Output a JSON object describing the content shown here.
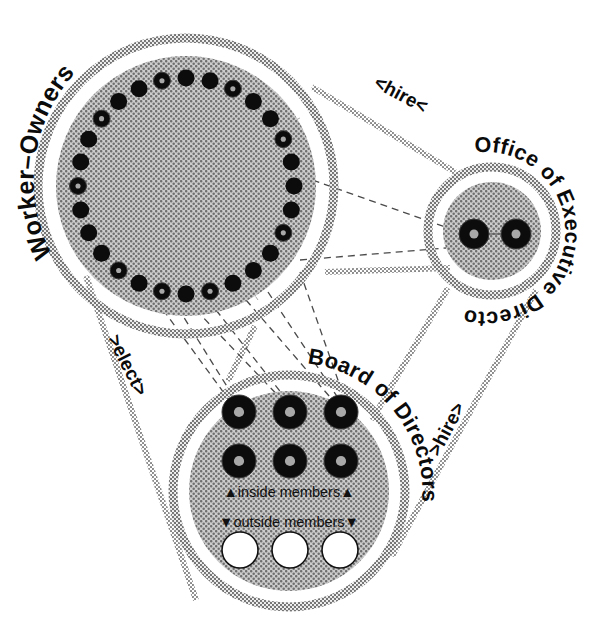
{
  "diagram": {
    "background_color": "#ffffff",
    "ink_color": "#111111",
    "fill_color": "#c8c8c8",
    "ring_color": "#9a9a9a"
  },
  "nodes": [
    {
      "id": "worker-owners",
      "label": "Worker–Owners",
      "cx": 186,
      "cy": 186,
      "outer_r": 148,
      "inner_r": 130,
      "member_ring_r": 108,
      "member_count": 28,
      "member_dot_r": 8.5,
      "members": [
        {
          "index": 0,
          "type": "solid"
        },
        {
          "index": 1,
          "type": "solid"
        },
        {
          "index": 2,
          "type": "ringed"
        },
        {
          "index": 3,
          "type": "solid"
        },
        {
          "index": 4,
          "type": "solid"
        },
        {
          "index": 5,
          "type": "ringed"
        },
        {
          "index": 6,
          "type": "solid"
        },
        {
          "index": 7,
          "type": "solid"
        },
        {
          "index": 8,
          "type": "solid"
        },
        {
          "index": 9,
          "type": "ringed"
        },
        {
          "index": 10,
          "type": "solid"
        },
        {
          "index": 11,
          "type": "solid"
        },
        {
          "index": 12,
          "type": "solid"
        },
        {
          "index": 13,
          "type": "ringed"
        },
        {
          "index": 14,
          "type": "solid"
        },
        {
          "index": 15,
          "type": "ringed"
        },
        {
          "index": 16,
          "type": "solid"
        },
        {
          "index": 17,
          "type": "ringed"
        },
        {
          "index": 18,
          "type": "solid"
        },
        {
          "index": 19,
          "type": "solid"
        },
        {
          "index": 20,
          "type": "solid"
        },
        {
          "index": 21,
          "type": "ringed"
        },
        {
          "index": 22,
          "type": "solid"
        },
        {
          "index": 23,
          "type": "solid"
        },
        {
          "index": 24,
          "type": "ringed"
        },
        {
          "index": 25,
          "type": "solid"
        },
        {
          "index": 26,
          "type": "solid"
        },
        {
          "index": 27,
          "type": "ringed"
        }
      ]
    },
    {
      "id": "office-of-executive-directors",
      "label": "Office of Executive Directors",
      "cx": 492,
      "cy": 231,
      "outer_r": 64,
      "inner_r": 49,
      "members": [
        {
          "id": "exec-1",
          "cx": 474,
          "cy": 234,
          "r": 15,
          "type": "ringed"
        },
        {
          "id": "exec-2",
          "cx": 516,
          "cy": 234,
          "r": 15,
          "type": "ringed"
        }
      ]
    },
    {
      "id": "board-of-directors",
      "label": "Board of Directors",
      "cx": 289,
      "cy": 491,
      "outer_r": 116,
      "inner_r": 100,
      "inside_members_label": "▲inside members▲",
      "outside_members_label": "▼outside members▼",
      "inside_members": [
        {
          "id": "inside-1",
          "cx": 239,
          "cy": 412,
          "r": 17,
          "type": "ringed"
        },
        {
          "id": "inside-2",
          "cx": 290,
          "cy": 412,
          "r": 17,
          "type": "ringed"
        },
        {
          "id": "inside-3",
          "cx": 341,
          "cy": 412,
          "r": 17,
          "type": "ringed"
        },
        {
          "id": "inside-4",
          "cx": 239,
          "cy": 461,
          "r": 17,
          "type": "ringed"
        },
        {
          "id": "inside-5",
          "cx": 290,
          "cy": 461,
          "r": 17,
          "type": "ringed"
        },
        {
          "id": "inside-6",
          "cx": 341,
          "cy": 461,
          "r": 17,
          "type": "ringed"
        }
      ],
      "outside_members": [
        {
          "id": "outside-1",
          "cx": 240,
          "cy": 550,
          "r": 18,
          "type": "hollow"
        },
        {
          "id": "outside-2",
          "cx": 290,
          "cy": 550,
          "r": 18,
          "type": "hollow"
        },
        {
          "id": "outside-3",
          "cx": 340,
          "cy": 550,
          "r": 18,
          "type": "hollow"
        }
      ]
    }
  ],
  "edges": [
    {
      "id": "worker-owners-hires-executives",
      "label": "<hire<",
      "from": "office-of-executive-directors",
      "to": "worker-owners",
      "direction": "left",
      "label_x": 398,
      "label_y": 100,
      "label_rotate": 28
    },
    {
      "id": "worker-owners-elect-board",
      "label": ">elect>",
      "from": "worker-owners",
      "to": "board-of-directors",
      "direction": "down-right",
      "label_x": 122,
      "label_y": 368,
      "label_rotate": 63
    },
    {
      "id": "board-hires-executives",
      "label": ">hire>",
      "from": "board-of-directors",
      "to": "office-of-executive-directors",
      "direction": "up-right",
      "label_x": 452,
      "label_y": 432,
      "label_rotate": -62
    }
  ]
}
